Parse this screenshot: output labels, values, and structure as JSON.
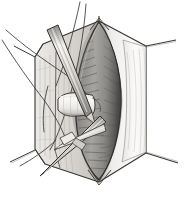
{
  "figure": {
    "medium": "grayscale pen-and-ink / wash anatomical drawing",
    "width": 188,
    "height": 198,
    "background_color": "#ffffff",
    "outline_color": "#2b2b2b",
    "caption": ""
  },
  "palette": {
    "paper": "#ffffff",
    "ink": "#2b2b2b",
    "flap_light": "#f2f1ef",
    "flap_mid": "#d9d7d3",
    "flap_shadow": "#b3b0ab",
    "organ_light": "#b9b7b4",
    "organ_mid": "#8d8b88",
    "organ_dark": "#5e5c5a",
    "organ_deepest": "#3c3a39",
    "instrument_light": "#efeeec",
    "instrument_mid": "#c6c4c0",
    "instrument_dark": "#7d7b78",
    "tube_highlight": "#f6f5f3",
    "suture": "#3a3a3a"
  },
  "regions": [
    {
      "id": "wound-retractor-frame",
      "label": "Hexagonal retracted wound margin",
      "description": "Six-sided opened field formed by reflected tissue flaps with pointed apex at top and bottom"
    },
    {
      "id": "left-flap",
      "label": "Left reflected tissue flap",
      "description": "Pale vertically striated flap panel on the left side of the field"
    },
    {
      "id": "right-flap",
      "label": "Right reflected tissue flap",
      "description": "Pale flap panel with fold crease running top apex to bottom apex"
    },
    {
      "id": "central-organ",
      "label": "Exposed organ / muscle belly",
      "description": "Large ovoid mid-grey structure with dense diagonal hatching occupying the centre of the field"
    },
    {
      "id": "tubular-structure",
      "label": "Mobilised tubular structure",
      "description": "Pale horizontal tube (vessel or nerve) lifted away from the organ at mid-left"
    },
    {
      "id": "retraction-sutures",
      "label": "Retraction sutures",
      "description": "Fine curved threads sweeping off the upper-left and lower-left corners"
    },
    {
      "id": "instrument-upper",
      "label": "Upper instrument shaft",
      "description": "Straight tapered instrument entering from upper left, tip directed toward the organ"
    },
    {
      "id": "instrument-lower",
      "label": "Lower instrument shaft",
      "description": "Second tapered instrument crossing the first, running to the lower-left corner"
    },
    {
      "id": "corner-spurs",
      "label": "Lateral retractor spurs",
      "description": "Thin pointed spurs projecting from the left and right corners of the hexagonal field"
    }
  ],
  "labels": {
    "visible_text": []
  }
}
